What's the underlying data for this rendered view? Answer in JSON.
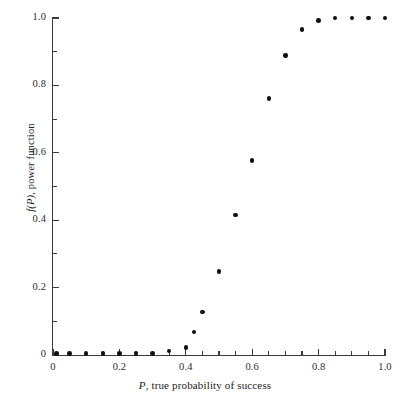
{
  "chart_data": {
    "type": "scatter",
    "title": "",
    "xlabel": "P, true probability of success",
    "ylabel": "f(P), power function",
    "xlim": [
      0.0,
      1.0
    ],
    "ylim": [
      0.0,
      1.0
    ],
    "grid": false,
    "legend": null,
    "xticks": [
      0.0,
      0.2,
      0.4,
      0.6,
      0.8,
      1.0
    ],
    "xtick_labels": [
      "0",
      "0.2",
      "0.4",
      "0.6",
      "0.8",
      "1.0"
    ],
    "xticks_minor": [
      0.05,
      0.1,
      0.15,
      0.25,
      0.3,
      0.35,
      0.45,
      0.5,
      0.55,
      0.65,
      0.7,
      0.75,
      0.85,
      0.9,
      0.95
    ],
    "yticks": [
      0.0,
      0.2,
      0.4,
      0.6,
      0.8,
      1.0
    ],
    "ytick_labels": [
      "0",
      "0.2",
      "0.4",
      "0.6",
      "0.8",
      "1.0"
    ],
    "yticks_minor": [
      0.1,
      0.3,
      0.5,
      0.7,
      0.9
    ],
    "marker": "filled-circle",
    "marker_color": "#101010",
    "x": [
      0.01,
      0.05,
      0.1,
      0.15,
      0.2,
      0.25,
      0.3,
      0.35,
      0.4,
      0.425,
      0.45,
      0.5,
      0.55,
      0.6,
      0.65,
      0.7,
      0.75,
      0.8,
      0.85,
      0.9,
      0.95,
      1.0
    ],
    "y": [
      0.005,
      0.005,
      0.005,
      0.005,
      0.005,
      0.005,
      0.005,
      0.012,
      0.022,
      0.068,
      0.128,
      0.248,
      0.415,
      0.578,
      0.762,
      0.888,
      0.965,
      0.992,
      1.0,
      1.0,
      1.0,
      1.0
    ]
  },
  "axes": {
    "x_title_prefix": "P",
    "x_title_rest": ", true probability of success",
    "y_title_prefix": "f(P)",
    "y_title_rest": ", power function"
  },
  "colors": {
    "axis": "#3a3a3a",
    "marker": "#101010",
    "background": "#ffffff",
    "text": "#1a1a1a"
  }
}
